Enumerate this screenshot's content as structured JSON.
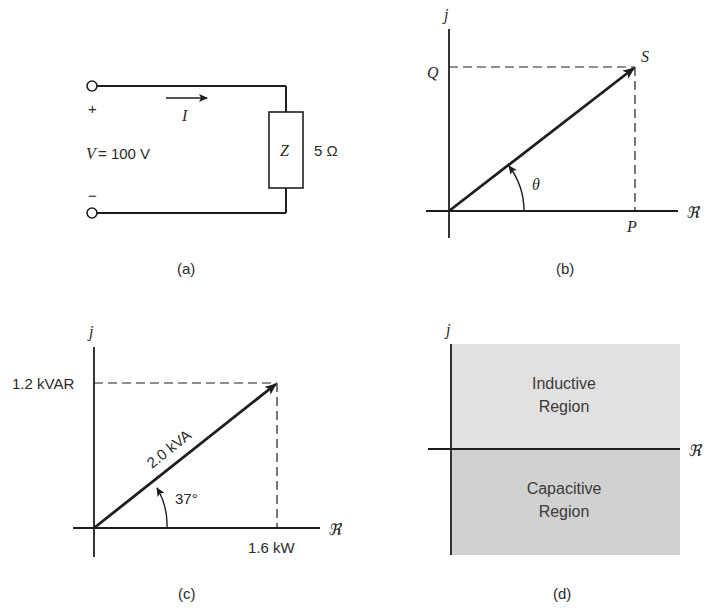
{
  "colors": {
    "line": "#1e1e1e",
    "inductive_fill": "#e2e2e2",
    "capacitive_fill": "#d2d2d2"
  },
  "panel_a": {
    "caption": "(a)",
    "plus": "+",
    "minus": "−",
    "current_label": "I",
    "voltage_label": "V",
    "voltage_value": "= 100 V",
    "impedance_symbol": "Z",
    "impedance_value": "5 Ω"
  },
  "panel_b": {
    "caption": "(b)",
    "imag_axis": "j",
    "real_axis": "ℜ",
    "q_label": "Q",
    "s_label": "S",
    "p_label": "P",
    "angle_label": "θ"
  },
  "panel_c": {
    "caption": "(c)",
    "imag_axis": "j",
    "real_axis": "ℜ",
    "reactive_label": "1.2 kVAR",
    "apparent_label": "2.0 kVA",
    "real_label": "1.6 kW",
    "angle_label": "37°"
  },
  "panel_d": {
    "caption": "(d)",
    "imag_axis": "j",
    "real_axis": "ℜ",
    "upper_region": [
      "Inductive",
      "Region"
    ],
    "lower_region": [
      "Capacitive",
      "Region"
    ]
  }
}
